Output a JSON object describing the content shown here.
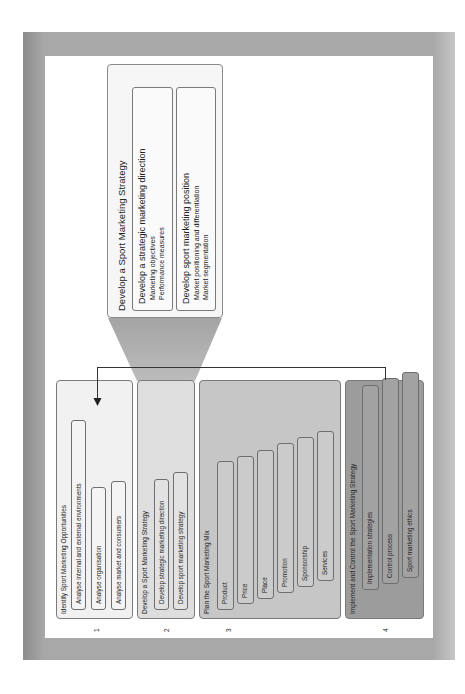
{
  "colors": {
    "frame": "#9a9a9a",
    "page": "#ffffff",
    "stage1": "#f1f1f1",
    "stage2": "#dedede",
    "stage3": "#c6c6c6",
    "stage4": "#9c9c9c",
    "callout": "#f6f6f6",
    "callout_connector": "#b0b0b0",
    "border": "#7a7a7a"
  },
  "stages": [
    {
      "number": "1",
      "title": "Identify Sport Marketing Opportunities",
      "items": [
        "Analyse internal and external environments",
        "Analyse organisation",
        "Analyse market and consumers"
      ]
    },
    {
      "number": "2",
      "title": "Develop a Sport Marketing Strategy",
      "items": [
        "Develop strategic marketing direction",
        "Develop sport marketing strategy"
      ]
    },
    {
      "number": "3",
      "title": "Plan the Sport Marketing Mix",
      "items": [
        "Product",
        "Price",
        "Place",
        "Promotion",
        "Sponsorship",
        "Services"
      ]
    },
    {
      "number": "4",
      "title": "Implement and Control the Sport Marketing Strategy",
      "items": [
        "Implementation strategies",
        "Control process",
        "Sport marketing ethics"
      ]
    }
  ],
  "callout": {
    "title": "Develop a Sport Marketing Strategy",
    "groups": [
      {
        "heading": "Develop a strategic marketing direction",
        "items": [
          "Marketing objectives",
          "Performance measures"
        ]
      },
      {
        "heading": "Develop sport marketing position",
        "items": [
          "Market positioning and differentiation",
          "Market segmentation"
        ]
      }
    ]
  }
}
